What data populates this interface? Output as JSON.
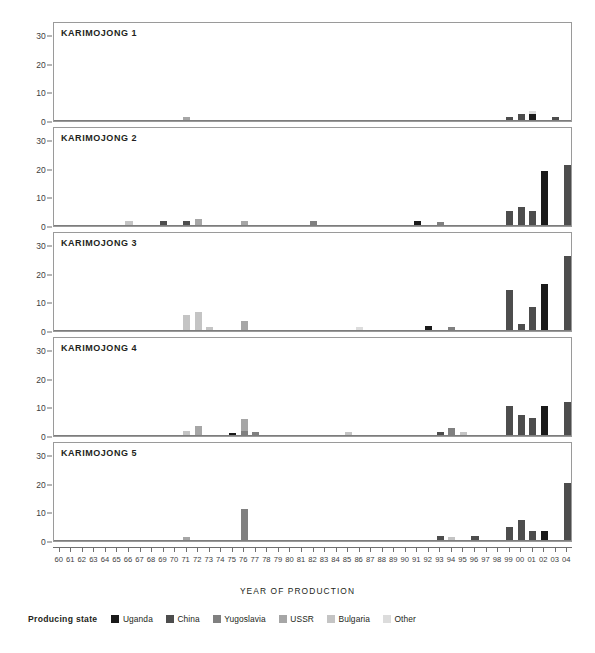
{
  "chart_data": {
    "type": "bar",
    "title": "",
    "xlabel": "YEAR OF PRODUCTION",
    "ylabel": "",
    "ylim": [
      0,
      35
    ],
    "y_ticks": [
      0,
      10,
      20,
      30
    ],
    "grid": false,
    "stacked": true,
    "legend_position": "bottom",
    "legend_title": "Producing state",
    "categories": [
      "60",
      "61",
      "62",
      "63",
      "64",
      "65",
      "66",
      "67",
      "68",
      "69",
      "70",
      "71",
      "72",
      "73",
      "74",
      "75",
      "76",
      "77",
      "78",
      "79",
      "80",
      "81",
      "82",
      "83",
      "84",
      "85",
      "86",
      "87",
      "88",
      "89",
      "90",
      "91",
      "92",
      "93",
      "94",
      "95",
      "96",
      "97",
      "98",
      "99",
      "00",
      "01",
      "02",
      "03",
      "04"
    ],
    "series_names": [
      "Uganda",
      "China",
      "Yugoslavia",
      "USSR",
      "Bulgaria",
      "Other"
    ],
    "series_colors": {
      "Uganda": "#1a1a1a",
      "China": "#4d4d4d",
      "Yugoslavia": "#808080",
      "USSR": "#a6a6a6",
      "Bulgaria": "#c4c4c4",
      "Other": "#dcdcdc"
    },
    "panels": [
      {
        "name": "KARIMOJONG 1",
        "bars": [
          {
            "year": "71",
            "segments": [
              {
                "state": "USSR",
                "value": 1.2
              }
            ]
          },
          {
            "year": "99",
            "segments": [
              {
                "state": "China",
                "value": 1.2
              }
            ]
          },
          {
            "year": "00",
            "segments": [
              {
                "state": "China",
                "value": 2.2
              }
            ]
          },
          {
            "year": "01",
            "segments": [
              {
                "state": "Uganda",
                "value": 2.0
              },
              {
                "state": "Other",
                "value": 1.3
              }
            ]
          },
          {
            "year": "03",
            "segments": [
              {
                "state": "China",
                "value": 1.2
              }
            ]
          }
        ]
      },
      {
        "name": "KARIMOJONG 2",
        "bars": [
          {
            "year": "66",
            "segments": [
              {
                "state": "Bulgaria",
                "value": 1.3
              }
            ]
          },
          {
            "year": "69",
            "segments": [
              {
                "state": "China",
                "value": 1.5
              }
            ]
          },
          {
            "year": "71",
            "segments": [
              {
                "state": "China",
                "value": 1.5
              }
            ]
          },
          {
            "year": "72",
            "segments": [
              {
                "state": "USSR",
                "value": 2.2
              }
            ]
          },
          {
            "year": "76",
            "segments": [
              {
                "state": "USSR",
                "value": 1.4
              }
            ]
          },
          {
            "year": "82",
            "segments": [
              {
                "state": "Yugoslavia",
                "value": 1.3
              }
            ]
          },
          {
            "year": "91",
            "segments": [
              {
                "state": "Uganda",
                "value": 1.4
              }
            ]
          },
          {
            "year": "93",
            "segments": [
              {
                "state": "Yugoslavia",
                "value": 1.2
              }
            ]
          },
          {
            "year": "99",
            "segments": [
              {
                "state": "China",
                "value": 5.0
              }
            ]
          },
          {
            "year": "00",
            "segments": [
              {
                "state": "China",
                "value": 6.3
              }
            ]
          },
          {
            "year": "01",
            "segments": [
              {
                "state": "China",
                "value": 5.0
              }
            ]
          },
          {
            "year": "02",
            "segments": [
              {
                "state": "Uganda",
                "value": 19.0
              }
            ]
          },
          {
            "year": "04",
            "segments": [
              {
                "state": "China",
                "value": 21.0
              }
            ]
          }
        ]
      },
      {
        "name": "KARIMOJONG 3",
        "bars": [
          {
            "year": "71",
            "segments": [
              {
                "state": "Bulgaria",
                "value": 5.2
              }
            ]
          },
          {
            "year": "72",
            "segments": [
              {
                "state": "Bulgaria",
                "value": 6.4
              }
            ]
          },
          {
            "year": "73",
            "segments": [
              {
                "state": "Bulgaria",
                "value": 1.2
              }
            ]
          },
          {
            "year": "76",
            "segments": [
              {
                "state": "USSR",
                "value": 3.0
              }
            ]
          },
          {
            "year": "86",
            "segments": [
              {
                "state": "Other",
                "value": 1.0
              }
            ]
          },
          {
            "year": "92",
            "segments": [
              {
                "state": "Uganda",
                "value": 1.3
              }
            ]
          },
          {
            "year": "94",
            "segments": [
              {
                "state": "Yugoslavia",
                "value": 1.2
              }
            ]
          },
          {
            "year": "99",
            "segments": [
              {
                "state": "China",
                "value": 14.0
              }
            ]
          },
          {
            "year": "00",
            "segments": [
              {
                "state": "China",
                "value": 2.2
              }
            ]
          },
          {
            "year": "01",
            "segments": [
              {
                "state": "China",
                "value": 8.0
              }
            ]
          },
          {
            "year": "02",
            "segments": [
              {
                "state": "Uganda",
                "value": 16.0
              }
            ]
          },
          {
            "year": "04",
            "segments": [
              {
                "state": "China",
                "value": 26.0
              }
            ]
          }
        ]
      },
      {
        "name": "KARIMOJONG 4",
        "bars": [
          {
            "year": "71",
            "segments": [
              {
                "state": "Bulgaria",
                "value": 1.4
              }
            ]
          },
          {
            "year": "72",
            "segments": [
              {
                "state": "USSR",
                "value": 3.3
              }
            ]
          },
          {
            "year": "75",
            "segments": [
              {
                "state": "Uganda",
                "value": 0.8
              }
            ]
          },
          {
            "year": "76",
            "segments": [
              {
                "state": "Yugoslavia",
                "value": 1.4
              },
              {
                "state": "USSR",
                "value": 4.2
              }
            ]
          },
          {
            "year": "77",
            "segments": [
              {
                "state": "Yugoslavia",
                "value": 1.2
              }
            ]
          },
          {
            "year": "85",
            "segments": [
              {
                "state": "Bulgaria",
                "value": 1.2
              }
            ]
          },
          {
            "year": "93",
            "segments": [
              {
                "state": "China",
                "value": 1.2
              }
            ]
          },
          {
            "year": "94",
            "segments": [
              {
                "state": "Yugoslavia",
                "value": 2.4
              }
            ]
          },
          {
            "year": "95",
            "segments": [
              {
                "state": "Bulgaria",
                "value": 1.0
              }
            ]
          },
          {
            "year": "99",
            "segments": [
              {
                "state": "China",
                "value": 10.3
              }
            ]
          },
          {
            "year": "00",
            "segments": [
              {
                "state": "China",
                "value": 7.0
              }
            ]
          },
          {
            "year": "01",
            "segments": [
              {
                "state": "China",
                "value": 5.8
              }
            ]
          },
          {
            "year": "02",
            "segments": [
              {
                "state": "Uganda",
                "value": 10.3
              }
            ]
          },
          {
            "year": "04",
            "segments": [
              {
                "state": "China",
                "value": 11.5
              }
            ]
          }
        ]
      },
      {
        "name": "KARIMOJONG 5",
        "bars": [
          {
            "year": "71",
            "segments": [
              {
                "state": "USSR",
                "value": 1.2
              }
            ]
          },
          {
            "year": "76",
            "segments": [
              {
                "state": "Yugoslavia",
                "value": 11.0
              }
            ]
          },
          {
            "year": "93",
            "segments": [
              {
                "state": "China",
                "value": 1.3
              }
            ]
          },
          {
            "year": "94",
            "segments": [
              {
                "state": "Bulgaria",
                "value": 1.1
              }
            ]
          },
          {
            "year": "96",
            "segments": [
              {
                "state": "China",
                "value": 1.3
              }
            ]
          },
          {
            "year": "99",
            "segments": [
              {
                "state": "China",
                "value": 4.6
              }
            ]
          },
          {
            "year": "00",
            "segments": [
              {
                "state": "China",
                "value": 7.0
              }
            ]
          },
          {
            "year": "01",
            "segments": [
              {
                "state": "China",
                "value": 3.0
              }
            ]
          },
          {
            "year": "02",
            "segments": [
              {
                "state": "Uganda",
                "value": 3.0
              }
            ]
          },
          {
            "year": "04",
            "segments": [
              {
                "state": "China",
                "value": 20.0
              }
            ]
          }
        ]
      }
    ]
  },
  "legend": {
    "title": "Producing state",
    "items": [
      {
        "label": "Uganda",
        "color": "#1a1a1a"
      },
      {
        "label": "China",
        "color": "#4d4d4d"
      },
      {
        "label": "Yugoslavia",
        "color": "#808080"
      },
      {
        "label": "USSR",
        "color": "#a6a6a6"
      },
      {
        "label": "Bulgaria",
        "color": "#c4c4c4"
      },
      {
        "label": "Other",
        "color": "#dcdcdc"
      }
    ]
  },
  "axis": {
    "x_title": "YEAR OF PRODUCTION"
  }
}
